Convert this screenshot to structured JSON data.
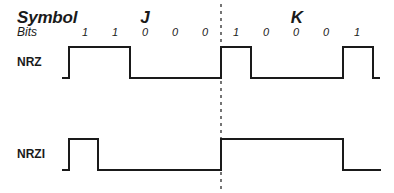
{
  "header": {
    "symbol_label": "Symbol",
    "bits_label": "Bits"
  },
  "symbols": [
    {
      "label": "J",
      "x": 145
    },
    {
      "label": "K",
      "x": 297
    }
  ],
  "bits": [
    {
      "value": "1",
      "x": 85
    },
    {
      "value": "1",
      "x": 115
    },
    {
      "value": "0",
      "x": 145
    },
    {
      "value": "0",
      "x": 175
    },
    {
      "value": "0",
      "x": 205
    },
    {
      "value": "1",
      "x": 236
    },
    {
      "value": "0",
      "x": 266
    },
    {
      "value": "0",
      "x": 296
    },
    {
      "value": "0",
      "x": 326
    },
    {
      "value": "1",
      "x": 357
    }
  ],
  "signals": {
    "nrz": {
      "label": "NRZ",
      "label_pos": {
        "x": 17,
        "y": 55
      },
      "points": "62,78 69,78 69,47 130,47 130,78 221,78 221,47 251,47 251,78 343,78 343,47 373,47 373,78 380,78"
    },
    "nrzi": {
      "label": "NRZI",
      "label_pos": {
        "x": 17,
        "y": 147
      },
      "points": "62,170 69,170 69,139 98,139 98,170 221,170 221,139 343,139 343,170 381,170"
    }
  },
  "divider": {
    "x": 221,
    "y1": 4,
    "y2": 193
  },
  "colors": {
    "line": "#1a1a1a",
    "background": "#ffffff"
  }
}
